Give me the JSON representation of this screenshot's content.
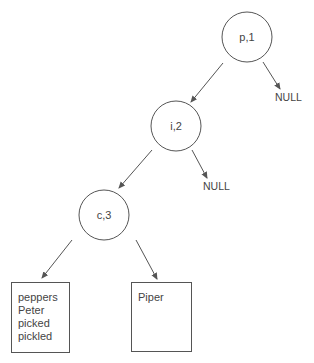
{
  "diagram": {
    "title": "",
    "colors": {
      "stroke": "#555555",
      "text": "#444444",
      "background": "#ffffff"
    },
    "nodes": [
      {
        "id": "p1",
        "label": "p,1",
        "cx": 247,
        "cy": 37,
        "r": 25
      },
      {
        "id": "i2",
        "label": "i,2",
        "cx": 176,
        "cy": 126,
        "r": 25
      },
      {
        "id": "c3",
        "label": "c,3",
        "cx": 104,
        "cy": 215,
        "r": 25
      }
    ],
    "null_labels": [
      {
        "id": "null-1",
        "text": "NULL",
        "x": 275,
        "y": 101
      },
      {
        "id": "null-2",
        "text": "NULL",
        "x": 203,
        "y": 190
      }
    ],
    "leaf_boxes": [
      {
        "id": "box-1",
        "x": 11,
        "y": 282,
        "w": 58,
        "h": 70,
        "lines": [
          "peppers",
          "Peter",
          "picked",
          "pickled"
        ]
      },
      {
        "id": "box-2",
        "x": 131,
        "y": 282,
        "w": 60,
        "h": 69,
        "lines": [
          "Piper"
        ]
      }
    ],
    "edges": [
      {
        "from": "p1",
        "to": "i2",
        "x1": 223,
        "y1": 63,
        "x2": 191,
        "y2": 102
      },
      {
        "from": "p1",
        "to": "null-1",
        "x1": 263,
        "y1": 62,
        "x2": 280,
        "y2": 89
      },
      {
        "from": "i2",
        "to": "c3",
        "x1": 152,
        "y1": 150,
        "x2": 119,
        "y2": 188
      },
      {
        "from": "i2",
        "to": "null-2",
        "x1": 192,
        "y1": 150,
        "x2": 207,
        "y2": 178
      },
      {
        "from": "c3",
        "to": "box-1",
        "x1": 72,
        "y1": 240,
        "x2": 42,
        "y2": 278
      },
      {
        "from": "c3",
        "to": "box-2",
        "x1": 136,
        "y1": 240,
        "x2": 157,
        "y2": 279
      }
    ]
  }
}
